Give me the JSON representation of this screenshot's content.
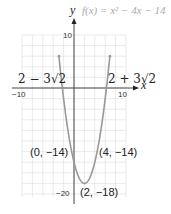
{
  "chart_data": {
    "type": "line",
    "title": "f(x) = x² − 4x − 14",
    "function": "f(x) = x^2 - 4x - 14",
    "xlabel": "x",
    "ylabel": "y",
    "xlim": [
      -10,
      10
    ],
    "ylim": [
      -20,
      10
    ],
    "grid": true,
    "x_ticks_labeled": [
      "-10",
      "10"
    ],
    "y_ticks_labeled": [
      "10",
      "-20"
    ],
    "series": [
      {
        "name": "f(x) = x^2 - 4x - 14",
        "color": "#999999",
        "x": [
          -4,
          -3,
          -2,
          -1,
          0,
          1,
          2,
          3,
          4,
          5,
          6,
          7,
          8
        ],
        "y": [
          18,
          7,
          -2,
          -9,
          -14,
          -17,
          -18,
          -17,
          -14,
          -9,
          -2,
          7,
          18
        ]
      }
    ],
    "annotations": [
      {
        "text": "2 − 3√2",
        "x": -2.24,
        "y": 0,
        "kind": "x-intercept"
      },
      {
        "text": "2 + 3√2",
        "x": 6.24,
        "y": 0,
        "kind": "x-intercept"
      },
      {
        "text": "(0, −14)",
        "x": 0,
        "y": -14,
        "kind": "point"
      },
      {
        "text": "(4, −14)",
        "x": 4,
        "y": -14,
        "kind": "point"
      },
      {
        "text": "(2, −18)",
        "x": 2,
        "y": -18,
        "kind": "vertex"
      }
    ]
  },
  "labels": {
    "function": "f(x) = x² − 4x − 14",
    "y_axis": "y",
    "x_axis": "x",
    "tick_x_min": "−10",
    "tick_x_max": "10",
    "tick_y_max": "10",
    "tick_y_min": "−20",
    "root_left": "2 − 3√2",
    "root_right": "2 + 3√2",
    "point_left": "(0, −14)",
    "point_right": "(4, −14)",
    "vertex": "(2, −18)"
  }
}
